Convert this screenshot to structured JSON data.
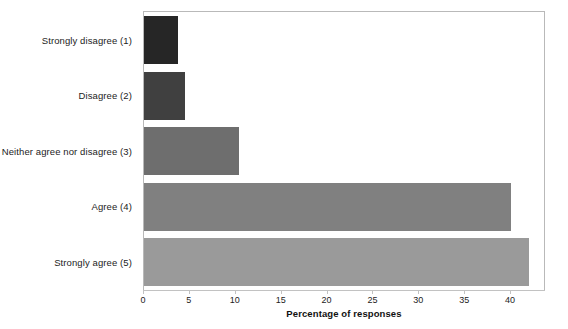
{
  "chart_data": {
    "type": "bar",
    "orientation": "horizontal",
    "title": "",
    "xlabel": "Percentage of responses",
    "ylabel": "",
    "categories": [
      "Strongly disagree (1)",
      "Disagree (2)",
      "Neither agree nor disagree (3)",
      "Agree (4)",
      "Strongly agree (5)"
    ],
    "values": [
      3.7,
      4.5,
      10.4,
      40.0,
      42.0
    ],
    "bar_colors": [
      "#262626",
      "#404040",
      "#6e6e6e",
      "#808080",
      "#9a9a9a"
    ],
    "xlim": [
      0,
      43.7
    ],
    "xticks": [
      0,
      5,
      10,
      15,
      20,
      25,
      30,
      35,
      40
    ],
    "xtick_labels": [
      "0",
      "5",
      "10",
      "15",
      "20",
      "25",
      "30",
      "35",
      "40"
    ],
    "grid": false,
    "legend": false,
    "frame_color": "#b9b9b9"
  }
}
